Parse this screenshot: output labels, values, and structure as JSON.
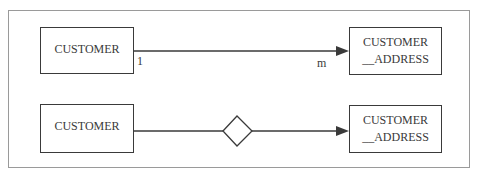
{
  "diagram": {
    "top_row": {
      "left_entity": {
        "label": "CUSTOMER"
      },
      "right_entity": {
        "line1": "CUSTOMER",
        "line2": "__ADDRESS"
      },
      "cardinality_left": "1",
      "cardinality_right": "m"
    },
    "bottom_row": {
      "left_entity": {
        "label": "CUSTOMER"
      },
      "right_entity": {
        "line1": "CUSTOMER",
        "line2": "__ADDRESS"
      },
      "relationship_shape": "diamond"
    },
    "colors": {
      "stroke": "#3a3a3a",
      "frame": "#9a9a9a"
    }
  }
}
